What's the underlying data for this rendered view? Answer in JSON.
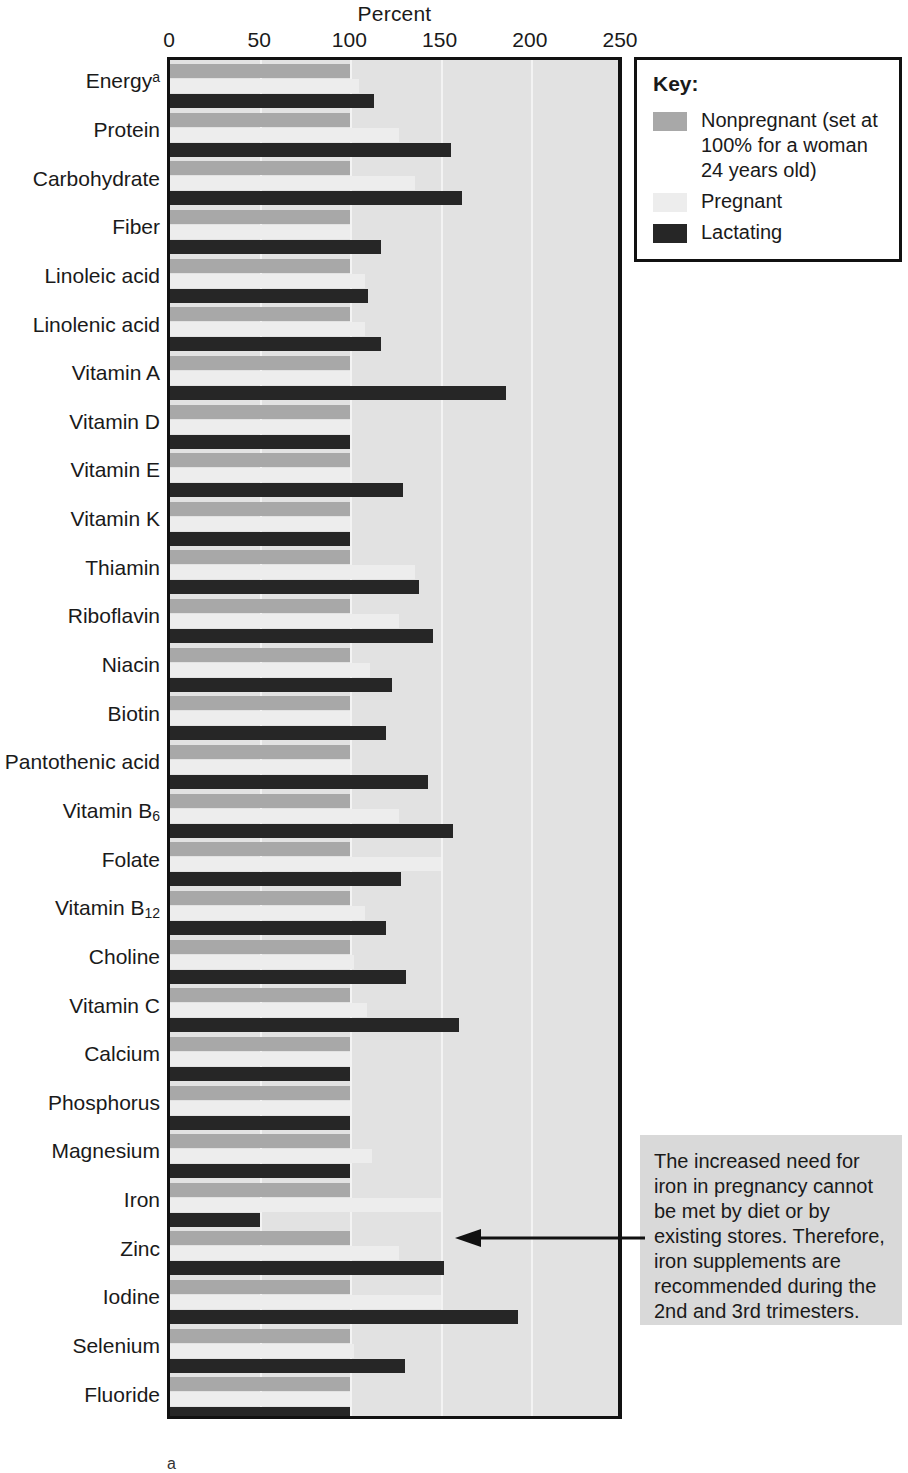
{
  "chart_data": {
    "type": "bar",
    "orientation": "horizontal",
    "title": "",
    "xlabel": "Percent",
    "ylabel": "",
    "xlim": [
      0,
      250
    ],
    "xticks": [
      0,
      50,
      100,
      150,
      200,
      250
    ],
    "grid": true,
    "legend_position": "top-right",
    "categories": [
      "Energyᵃ",
      "Protein",
      "Carbohydrate",
      "Fiber",
      "Linoleic acid",
      "Linolenic acid",
      "Vitamin A",
      "Vitamin D",
      "Vitamin E",
      "Vitamin K",
      "Thiamin",
      "Riboflavin",
      "Niacin",
      "Biotin",
      "Pantothenic acid",
      "Vitamin B₆",
      "Folate",
      "Vitamin B₁₂",
      "Choline",
      "Vitamin C",
      "Calcium",
      "Phosphorus",
      "Magnesium",
      "Iron",
      "Zinc",
      "Iodine",
      "Selenium",
      "Fluoride"
    ],
    "series": [
      {
        "name": "Nonpregnant (set at 100% for a woman 24 years old)",
        "short_name": "Nonpregnant",
        "color": "#a8a8a8",
        "values": [
          100,
          100,
          100,
          100,
          100,
          100,
          100,
          100,
          100,
          100,
          100,
          100,
          100,
          100,
          100,
          100,
          100,
          100,
          100,
          100,
          100,
          100,
          100,
          100,
          100,
          100,
          100,
          100
        ]
      },
      {
        "name": "Pregnant",
        "short_name": "Pregnant",
        "color": "#ededed",
        "values": [
          105,
          127,
          136,
          100,
          108,
          108,
          100,
          100,
          100,
          100,
          136,
          127,
          111,
          100,
          100,
          127,
          150,
          108,
          102,
          109,
          100,
          100,
          112,
          150,
          127,
          150,
          102,
          100
        ]
      },
      {
        "name": "Lactating",
        "short_name": "Lactating",
        "color": "#262626",
        "values": [
          113,
          156,
          162,
          117,
          110,
          117,
          186,
          100,
          129,
          100,
          138,
          146,
          123,
          120,
          143,
          157,
          128,
          120,
          131,
          160,
          100,
          100,
          100,
          50,
          152,
          193,
          130,
          100
        ]
      }
    ]
  },
  "axis": {
    "title": "Percent",
    "tick_labels": [
      "0",
      "50",
      "100",
      "150",
      "200",
      "250"
    ]
  },
  "key": {
    "title": "Key:",
    "entries": [
      {
        "label": "Nonpregnant (set at 100% for a woman 24 years old)",
        "swatch": "np"
      },
      {
        "label": "Pregnant",
        "swatch": "pg"
      },
      {
        "label": "Lactating",
        "swatch": "lac"
      }
    ]
  },
  "annotation": {
    "text": "The increased need for iron in pregnancy cannot be met by diet or by existing stores. Therefore, iron supplements are recommended during the 2nd and 3rd trimesters."
  },
  "footnote": {
    "marker": "a"
  },
  "colors": {
    "nonpregnant": "#a8a8a8",
    "pregnant": "#ededed",
    "lactating": "#262626",
    "plot_background": "#e2e2e2",
    "annotation_background": "#d9d9d9",
    "axis": "#111111"
  }
}
